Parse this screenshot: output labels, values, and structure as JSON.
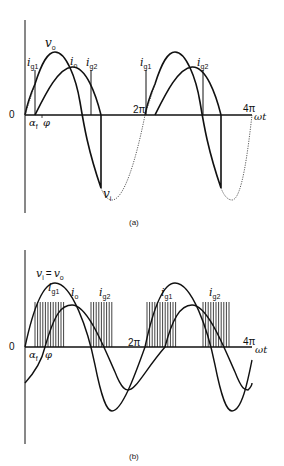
{
  "diagram_a": {
    "caption": "(a)",
    "origin_label": "0",
    "axis_label": "ωt",
    "ticks": [
      "2π",
      "4π"
    ],
    "angle_labels": [
      "α",
      "f",
      "φ"
    ],
    "curves": {
      "vo": {
        "sym": "v",
        "sub": "o"
      },
      "io": {
        "sym": "i",
        "sub": "o"
      },
      "vi": {
        "sym": "v",
        "sub": "i"
      }
    },
    "gates": [
      {
        "sym": "i",
        "sub": "g1"
      },
      {
        "sym": "i",
        "sub": "g2"
      },
      {
        "sym": "i",
        "sub": "g1"
      },
      {
        "sym": "i",
        "sub": "g2"
      }
    ]
  },
  "diagram_b": {
    "caption": "(b)",
    "origin_label": "0",
    "axis_label": "ωt",
    "ticks": [
      "2π",
      "4π"
    ],
    "angle_labels": [
      "α",
      "f",
      "φ"
    ],
    "curves": {
      "vi_vo": {
        "sym": "v",
        "sub": "i",
        "eq": "=",
        "sym2": "v",
        "sub2": "o"
      },
      "io": {
        "sym": "i",
        "sub": "o"
      }
    },
    "gates": [
      {
        "sym": "i",
        "sub": "g1"
      },
      {
        "sym": "i",
        "sub": "g2"
      },
      {
        "sym": "i",
        "sub": "g1"
      },
      {
        "sym": "i",
        "sub": "g2"
      }
    ]
  },
  "colors": {
    "line": "#111111",
    "background": "#ffffff"
  }
}
